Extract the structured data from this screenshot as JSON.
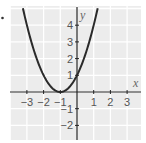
{
  "chart_data": {
    "type": "line",
    "title": "",
    "equation": "y = (x + 1)^2",
    "xlabel": "x",
    "ylabel": "y",
    "xlim": [
      -4,
      3.8
    ],
    "ylim": [
      -3,
      5.1
    ],
    "x_ticks": [
      -3,
      -2,
      -1,
      1,
      2,
      3
    ],
    "y_ticks": [
      -2,
      -1,
      1,
      2,
      3,
      4
    ],
    "x_tick_labels": [
      "−3",
      "−2",
      "−1",
      "1",
      "2",
      "3"
    ],
    "y_tick_labels": [
      "−2",
      "−1",
      "1",
      "2",
      "3",
      "4"
    ],
    "grid": true,
    "legend": null,
    "series": [
      {
        "name": "parabola",
        "x": [
          -3.24,
          -3,
          -2.5,
          -2,
          -1.5,
          -1,
          -0.5,
          0,
          0.5,
          1,
          1.24
        ],
        "values": [
          5.0,
          4,
          2.25,
          1,
          0.25,
          0,
          0.25,
          1,
          2.25,
          4,
          5.0
        ]
      }
    ],
    "vertex": [
      -1,
      0
    ],
    "y_intercept": [
      0,
      1
    ]
  },
  "colors": {
    "grid_background": "#ececec",
    "grid_lines": "#ffffff",
    "axes": "#222222",
    "curve": "#2a2a2a",
    "labels": "#555555"
  },
  "marker": "•"
}
